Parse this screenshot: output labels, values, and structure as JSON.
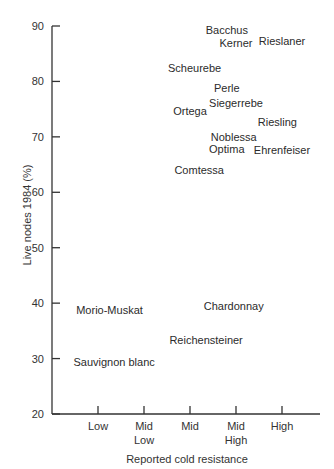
{
  "chart_data": {
    "type": "scatter",
    "title": "",
    "xlabel": "Reported cold resistance",
    "ylabel": "Live nodes 1984 (%)",
    "x_categories": [
      "Low",
      "Mid\nLow",
      "Mid",
      "Mid\nHigh",
      "High"
    ],
    "x_category_labels": [
      {
        "line1": "Low",
        "line2": ""
      },
      {
        "line1": "Mid",
        "line2": "Low"
      },
      {
        "line1": "Mid",
        "line2": ""
      },
      {
        "line1": "Mid",
        "line2": "High"
      },
      {
        "line1": "High",
        "line2": ""
      }
    ],
    "ylim": [
      20,
      90
    ],
    "yticks": [
      20,
      30,
      40,
      50,
      60,
      70,
      80,
      90
    ],
    "grid": false,
    "legend": null,
    "points": [
      {
        "label": "Bacchus",
        "x": 3.8,
        "y": 89.3
      },
      {
        "label": "Kerner",
        "x": 4.0,
        "y": 86.9
      },
      {
        "label": "Rieslaner",
        "x": 5.0,
        "y": 87.3
      },
      {
        "label": "Scheurebe",
        "x": 3.1,
        "y": 82.4
      },
      {
        "label": "Perle",
        "x": 3.8,
        "y": 78.8
      },
      {
        "label": "Siegerrebe",
        "x": 4.0,
        "y": 76.1
      },
      {
        "label": "Ortega",
        "x": 3.0,
        "y": 74.7
      },
      {
        "label": "Riesling",
        "x": 4.9,
        "y": 72.7
      },
      {
        "label": "Noblessa",
        "x": 3.95,
        "y": 70.0
      },
      {
        "label": "Optima",
        "x": 3.8,
        "y": 67.8
      },
      {
        "label": "Ehrenfeiser",
        "x": 5.0,
        "y": 67.6
      },
      {
        "label": "Comtessa",
        "x": 3.2,
        "y": 64.0
      },
      {
        "label": "Chardonnay",
        "x": 3.95,
        "y": 39.5
      },
      {
        "label": "Morio-Muskat",
        "x": 1.25,
        "y": 38.8
      },
      {
        "label": "Reichensteiner",
        "x": 3.35,
        "y": 33.4
      },
      {
        "label": "Sauvignon blanc",
        "x": 1.35,
        "y": 29.4
      }
    ]
  },
  "layout": {
    "axis_color": "#333333",
    "text_color": "#2b2b2b"
  }
}
